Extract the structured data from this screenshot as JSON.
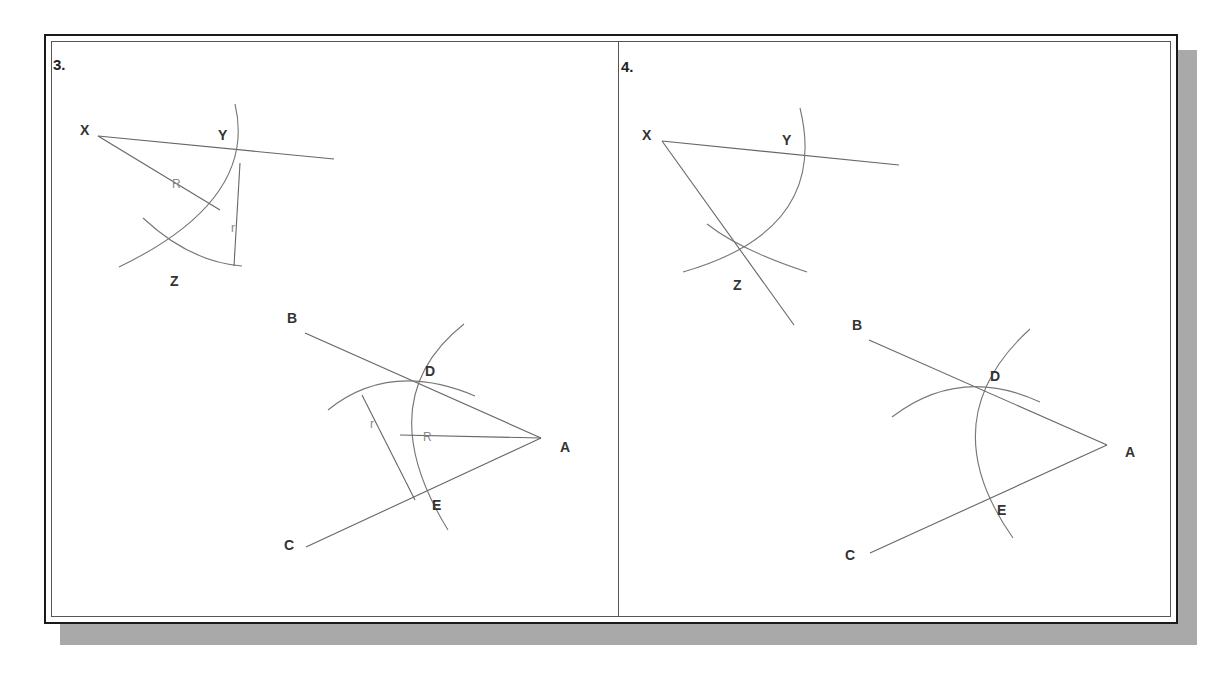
{
  "figure": {
    "panels": [
      {
        "number": "3.",
        "labels": {
          "X": "X",
          "Y": "Y",
          "Z": "Z",
          "A": "A",
          "B": "B",
          "C": "C",
          "D": "D",
          "E": "E"
        },
        "dimensions": {
          "R_upper": "R",
          "r_upper": "r",
          "R_lower": "R",
          "r_lower": "r"
        }
      },
      {
        "number": "4.",
        "labels": {
          "X": "X",
          "Y": "Y",
          "Z": "Z",
          "A": "A",
          "B": "B",
          "C": "C",
          "D": "D",
          "E": "E"
        }
      }
    ],
    "colors": {
      "line": "#666666",
      "shadow": "#a9a9a9",
      "frame": "#1a1a1a"
    }
  }
}
